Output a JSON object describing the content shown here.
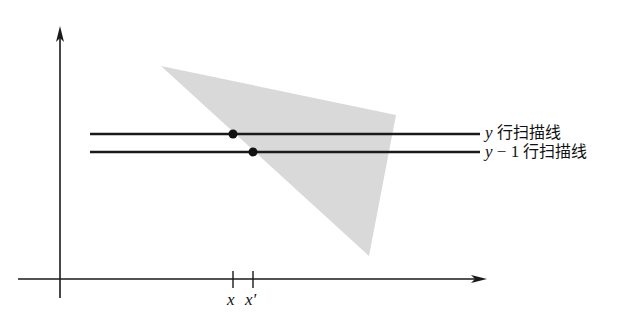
{
  "diagram": {
    "type": "scanline-polygon-fill",
    "colors": {
      "polygon_fill": "#d9d9d9",
      "line": "#1a1a1a",
      "background": "#ffffff"
    },
    "axes": {
      "origin": [
        60,
        279
      ],
      "y_axis_top": [
        60,
        26
      ],
      "x_axis_right": [
        487,
        279
      ]
    },
    "polygon": {
      "vertices": [
        [
          161,
          66
        ],
        [
          396,
          115
        ],
        [
          369,
          256
        ]
      ]
    },
    "scanlines": [
      {
        "id": "y",
        "var": "y",
        "suffix": "行扫描线",
        "y": 134,
        "x_start": 90,
        "x_end": 480,
        "intersection_x": 233
      },
      {
        "id": "y-1",
        "var": "y",
        "minus": " − 1",
        "suffix": "行扫描线",
        "y": 152,
        "x_start": 90,
        "x_end": 480,
        "intersection_x": 253
      }
    ],
    "ticks": [
      {
        "label": "x",
        "x": 233
      },
      {
        "label": "x′",
        "x": 253
      }
    ]
  }
}
